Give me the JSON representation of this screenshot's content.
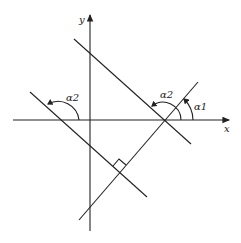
{
  "diagram": {
    "axes": {
      "x_label": "x",
      "y_label": "y"
    },
    "angle_labels": {
      "alpha1": "α1",
      "alpha2_right": "α2",
      "alpha2_left": "α2"
    }
  }
}
